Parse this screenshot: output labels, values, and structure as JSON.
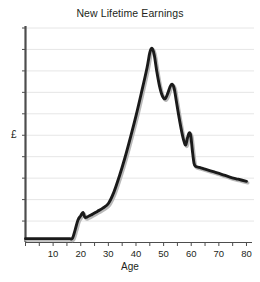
{
  "chart_data": {
    "type": "line",
    "title": "New Lifetime Earnings",
    "xlabel": "Age",
    "ylabel": "£",
    "xlim": [
      0,
      82
    ],
    "ylim": [
      0,
      10
    ],
    "grid": true,
    "legend": false,
    "xticks": [
      0,
      5,
      10,
      15,
      20,
      25,
      30,
      35,
      40,
      45,
      50,
      55,
      60,
      65,
      70,
      75,
      80
    ],
    "xtick_labels": [
      "10",
      "20",
      "30",
      "40",
      "50",
      "60",
      "70",
      "80"
    ],
    "xtick_labeled_values": [
      10,
      20,
      30,
      40,
      50,
      60,
      70,
      80
    ],
    "ytick_count": 10,
    "ytick_labels": [],
    "series": [
      {
        "name": "New Lifetime Earnings",
        "color": "#1a1a1a",
        "x": [
          0,
          5,
          10,
          14,
          16,
          17,
          18,
          19,
          20,
          20.8,
          21.5,
          22.5,
          24,
          26,
          28,
          30,
          32,
          34,
          36,
          38,
          40,
          42,
          44,
          45,
          45.8,
          46.6,
          47.5,
          48.5,
          49.5,
          50.5,
          51.5,
          52.3,
          53,
          53.8,
          54.6,
          55.5,
          56.5,
          57.3,
          58,
          58.6,
          59.2,
          59.8,
          60.4,
          61,
          61.6,
          63,
          65,
          68,
          71,
          74,
          77,
          80
        ],
        "y": [
          0.18,
          0.18,
          0.18,
          0.18,
          0.18,
          0.2,
          0.6,
          1.05,
          1.25,
          1.4,
          1.18,
          1.2,
          1.3,
          1.45,
          1.6,
          1.82,
          2.35,
          3.1,
          3.95,
          4.9,
          5.9,
          7.0,
          8.15,
          8.85,
          9.05,
          8.75,
          8.0,
          7.3,
          6.85,
          6.7,
          6.95,
          7.25,
          7.38,
          7.2,
          6.6,
          5.9,
          5.2,
          4.75,
          4.55,
          4.85,
          5.1,
          5.0,
          4.3,
          3.7,
          3.55,
          3.5,
          3.42,
          3.3,
          3.18,
          3.05,
          2.95,
          2.85
        ]
      }
    ],
    "annotations": [
      {
        "label": "flat-until-age-17",
        "value": 0.18
      },
      {
        "label": "first-bump-age-21",
        "value": 1.4
      },
      {
        "label": "main-peak-age-46",
        "value": 9.05
      },
      {
        "label": "second-peak-age-53",
        "value": 7.38
      },
      {
        "label": "third-peak-age-59",
        "value": 5.1
      },
      {
        "label": "retirement-drop-age-61",
        "value": 3.55
      },
      {
        "label": "end-age-80",
        "value": 2.85
      }
    ]
  },
  "style": {
    "line_color": "#1a1a1a",
    "grid_color": "#e3e3e3",
    "axis_color": "#4d4d4d",
    "background": "#ffffff",
    "text_color": "#231f20"
  }
}
